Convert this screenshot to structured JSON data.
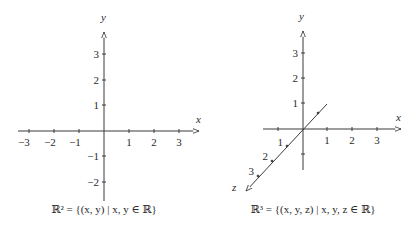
{
  "left_diagram": {
    "x_axis_label": "x",
    "y_axis_label": "y",
    "x_ticks": [
      "−3",
      "−2",
      "−1",
      "1",
      "2",
      "3"
    ],
    "y_ticks": [
      "3",
      "2",
      "1",
      "−1",
      "−2"
    ],
    "caption": "ℝ² = {(x, y) | x, y ∈ ℝ}"
  },
  "right_diagram": {
    "x_axis_label": "x",
    "y_axis_label": "y",
    "z_axis_label": "z",
    "x_ticks": [
      "1",
      "2",
      "3"
    ],
    "y_ticks": [
      "3",
      "2",
      "1"
    ],
    "z_ticks": [
      "1",
      "2",
      "3"
    ],
    "caption": "ℝ³ = {(x, y, z) | x, y, z ∈ ℝ}"
  },
  "colors": {
    "stroke": "#3a3a3a",
    "text": "#2a2a2a",
    "background": "#ffffff"
  }
}
